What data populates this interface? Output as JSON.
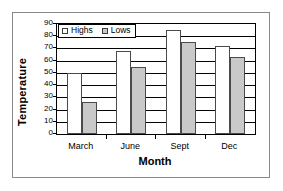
{
  "chart_data": {
    "type": "bar",
    "title": "",
    "xlabel": "Month",
    "ylabel": "Temperature",
    "categories": [
      "March",
      "June",
      "Sept",
      "Dec"
    ],
    "series": [
      {
        "name": "Highs",
        "values": [
          50,
          68,
          85,
          72
        ],
        "color": "#ffffff"
      },
      {
        "name": "Lows",
        "values": [
          26,
          55,
          75,
          63
        ],
        "color": "#c9c9c9"
      }
    ],
    "ylim": [
      0,
      90
    ],
    "ytick_step": 10,
    "yticks": [
      90,
      80,
      70,
      60,
      50,
      40,
      30,
      20,
      10,
      0
    ],
    "ytick_labels": [
      "90",
      "80",
      "70",
      "60",
      "50",
      "40",
      "30",
      "20",
      "10",
      "0"
    ],
    "grid": true,
    "grid_axis": "y",
    "legend_position": "top-left-inside",
    "legend": [
      "Highs",
      "Lows"
    ]
  },
  "axis": {
    "y_title": "Temperature",
    "x_title": "Month"
  },
  "legend": {
    "items": [
      {
        "label": "Highs",
        "swatch": "white-square-icon"
      },
      {
        "label": "Lows",
        "swatch": "gray-square-icon"
      }
    ]
  }
}
